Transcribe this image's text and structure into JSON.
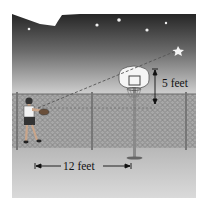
{
  "figure": {
    "labels": {
      "height_difference": "5 feet",
      "horizontal_distance": "12 feet"
    },
    "elements": [
      "night-sky",
      "stars",
      "dashed-sightline",
      "basketball-hoop",
      "backboard",
      "pole",
      "chain-link-fence",
      "person-holding-ball",
      "ground"
    ],
    "colors": {
      "sky_top": "#2a2a2a",
      "sky_bottom": "#d2d2d2",
      "ground": "#c4c4c4",
      "fence": "#8c8c8c",
      "star": "#f2f2f2"
    }
  }
}
